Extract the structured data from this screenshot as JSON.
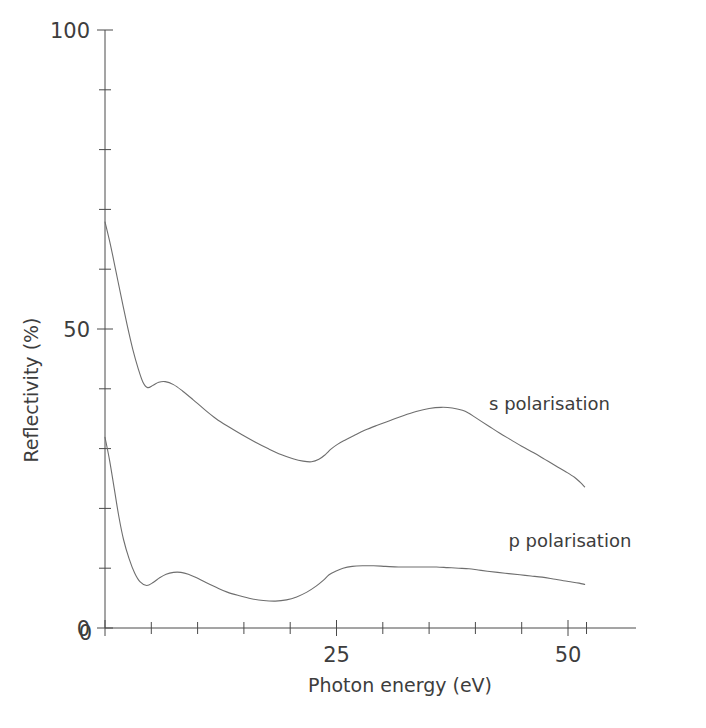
{
  "chart_data": {
    "type": "line",
    "title": "",
    "xlabel": "Photon energy (eV)",
    "ylabel": "Reflectivity (%)",
    "xlim": [
      0,
      52
    ],
    "ylim": [
      0,
      100
    ],
    "grid": false,
    "legend_position": "inline-right-of-curve",
    "x_ticks_major": [
      0,
      25,
      50
    ],
    "x_tick_labels": [
      "0",
      "25",
      "50"
    ],
    "x_ticks_minor": [
      5,
      10,
      15,
      20,
      30,
      35,
      40,
      45
    ],
    "x_tick_interval": 5,
    "y_ticks_major": [
      0,
      50,
      100
    ],
    "y_tick_labels": [
      "0",
      "50",
      "100"
    ],
    "y_ticks_minor": [
      10,
      20,
      30,
      40,
      60,
      70,
      80,
      90
    ],
    "y_tick_interval": 10,
    "series": [
      {
        "name": "s polarisation",
        "label": "s polarisation",
        "color": "#6e6e6e",
        "label_x": 48.0,
        "label_y": 36.5,
        "x": [
          0.0,
          0.6,
          1.2,
          1.8,
          2.4,
          3.0,
          3.6,
          4.1,
          4.6,
          5.2,
          5.8,
          6.5,
          7.4,
          8.4,
          9.5,
          10.7,
          12.0,
          13.4,
          14.8,
          16.2,
          17.6,
          19.0,
          20.3,
          21.4,
          22.3,
          23.1,
          23.8,
          24.4,
          25.1,
          25.9,
          26.9,
          28.1,
          29.4,
          30.8,
          32.2,
          33.6,
          35.0,
          36.3,
          37.5,
          38.6,
          39.3,
          39.9,
          40.6,
          41.5,
          42.6,
          43.8,
          45.0,
          46.3,
          47.5,
          48.7,
          49.8,
          50.7,
          51.3,
          51.8
        ],
        "y": [
          67.9,
          64.0,
          59.5,
          55.0,
          50.6,
          46.6,
          43.3,
          41.1,
          40.2,
          40.6,
          41.1,
          41.2,
          40.7,
          39.6,
          38.2,
          36.6,
          35.0,
          33.6,
          32.3,
          31.1,
          30.0,
          29.0,
          28.3,
          27.9,
          27.8,
          28.2,
          29.0,
          29.9,
          30.7,
          31.4,
          32.2,
          33.1,
          33.9,
          34.7,
          35.5,
          36.2,
          36.7,
          36.9,
          36.8,
          36.4,
          35.9,
          35.3,
          34.6,
          33.7,
          32.6,
          31.5,
          30.4,
          29.3,
          28.2,
          27.1,
          26.1,
          25.2,
          24.4,
          23.6
        ]
      },
      {
        "name": "p polarisation",
        "label": "p polarisation",
        "color": "#6e6e6e",
        "label_x": 50.2,
        "label_y": 13.6,
        "x": [
          0.0,
          0.5,
          1.0,
          1.5,
          2.0,
          2.6,
          3.2,
          3.8,
          4.5,
          5.2,
          5.9,
          6.6,
          7.4,
          8.2,
          9.0,
          9.9,
          10.9,
          12.0,
          13.2,
          14.5,
          15.8,
          17.1,
          18.4,
          19.6,
          20.7,
          21.8,
          22.8,
          23.6,
          24.2,
          24.9,
          25.7,
          26.7,
          27.8,
          29.0,
          30.3,
          31.7,
          33.1,
          34.5,
          35.8,
          37.0,
          38.2,
          39.3,
          40.3,
          41.3,
          42.4,
          43.6,
          44.8,
          46.0,
          47.2,
          48.4,
          49.5,
          50.4,
          51.2,
          51.8
        ],
        "y": [
          31.9,
          28.0,
          23.3,
          18.6,
          14.8,
          11.6,
          9.2,
          7.7,
          7.1,
          7.6,
          8.4,
          9.0,
          9.3,
          9.3,
          9.0,
          8.4,
          7.6,
          6.8,
          6.0,
          5.4,
          4.9,
          4.6,
          4.5,
          4.7,
          5.2,
          6.0,
          7.0,
          8.0,
          8.9,
          9.5,
          10.0,
          10.3,
          10.4,
          10.4,
          10.3,
          10.2,
          10.2,
          10.2,
          10.2,
          10.1,
          10.0,
          9.9,
          9.7,
          9.5,
          9.3,
          9.1,
          8.9,
          8.7,
          8.5,
          8.2,
          7.9,
          7.7,
          7.5,
          7.3
        ]
      }
    ]
  },
  "axes": {
    "y_title": "Reflectivity (%)",
    "x_title": "Photon energy (eV)",
    "y_labels": [
      "100",
      "50",
      "0"
    ],
    "x_labels": [
      "0",
      "25",
      "50"
    ]
  }
}
